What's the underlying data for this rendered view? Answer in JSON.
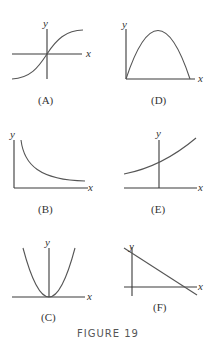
{
  "figure": {
    "caption": "FIGURE 19",
    "panels": [
      {
        "id": "A",
        "label": "(A)",
        "x_label": "x",
        "y_label": "y",
        "description": "S-shaped increasing curve through origin, axes crossing at center"
      },
      {
        "id": "D",
        "label": "(D)",
        "x_label": "x",
        "y_label": "y",
        "description": "Downward parabola arch starting at origin, returning to x-axis; axes at bottom-left"
      },
      {
        "id": "B",
        "label": "(B)",
        "x_label": "x",
        "y_label": "y",
        "description": "Decreasing convex curve approaching x-axis (reciprocal shape); axes at bottom-left"
      },
      {
        "id": "E",
        "label": "(E)",
        "x_label": "x",
        "y_label": "y",
        "description": "Increasing exponential-like curve above x-axis crossing y-axis at positive value"
      },
      {
        "id": "C",
        "label": "(C)",
        "x_label": "x",
        "y_label": "y",
        "description": "Upward parabola with vertex at origin"
      },
      {
        "id": "F",
        "label": "(F)",
        "x_label": "x",
        "y_label": "y",
        "description": "Decreasing straight line with positive y-intercept crossing x-axis"
      }
    ]
  },
  "colors": {
    "axis": "#3a3a3a",
    "curve": "#555555",
    "caption": "#555555"
  }
}
